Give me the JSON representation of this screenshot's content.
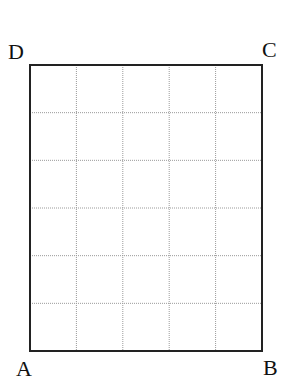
{
  "diagram": {
    "type": "grid-rectangle",
    "columns": 5,
    "rows": 6,
    "vertices": {
      "A": "A",
      "B": "B",
      "C": "C",
      "D": "D"
    },
    "colors": {
      "border": "#222222",
      "grid": "#999999"
    }
  }
}
